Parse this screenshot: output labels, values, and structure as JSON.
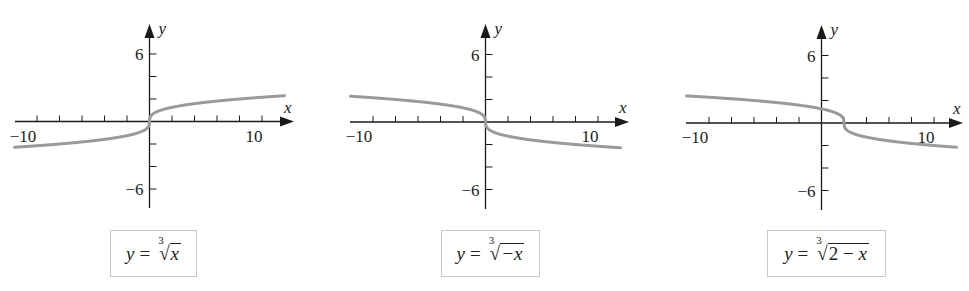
{
  "chart_data": [
    {
      "type": "line",
      "title": "",
      "function": "y = cbrt(x)",
      "formula_label": {
        "lhs": "y",
        "eq": "=",
        "index": "3",
        "radicand": "x"
      },
      "xlabel": "x",
      "ylabel": "y",
      "xlim": [
        -12,
        12
      ],
      "ylim": [
        -7.8,
        8.6
      ],
      "x_tick_labels": [
        "−10",
        "10"
      ],
      "x_tick_label_values": [
        -10,
        10
      ],
      "y_tick_labels": [
        "6",
        "−6"
      ],
      "y_tick_label_values": [
        6,
        -6
      ],
      "tick_step": 2,
      "grid": false,
      "legend": "none",
      "shift": 0,
      "reflect": false,
      "sample_points": {
        "x": [
          -12,
          -8,
          -2,
          0,
          2,
          8,
          12
        ],
        "y": [
          -2.29,
          -2,
          -1.26,
          0,
          1.26,
          2,
          2.29
        ]
      },
      "layout": {
        "ox": 149.5,
        "oy": 121.5,
        "unit": 11.25,
        "x_start": 15,
        "x_end": 294,
        "y_top": 24,
        "y_bottom": 208,
        "curve_x_range": [
          -12,
          12
        ],
        "box": {
          "left": 110,
          "top": 230,
          "width": 87,
          "height": 47
        }
      }
    },
    {
      "type": "line",
      "title": "",
      "function": "y = cbrt(-x)",
      "formula_label": {
        "lhs": "y",
        "eq": "=",
        "index": "3",
        "radicand": "−x"
      },
      "xlabel": "x",
      "ylabel": "y",
      "xlim": [
        -12,
        12
      ],
      "ylim": [
        -7.8,
        8.6
      ],
      "x_tick_labels": [
        "−10",
        "10"
      ],
      "x_tick_label_values": [
        -10,
        10
      ],
      "y_tick_labels": [
        "6",
        "−6"
      ],
      "y_tick_label_values": [
        6,
        -6
      ],
      "tick_step": 2,
      "grid": false,
      "legend": "none",
      "shift": 0,
      "reflect": true,
      "sample_points": {
        "x": [
          -12,
          -8,
          -2,
          0,
          2,
          8,
          12
        ],
        "y": [
          2.29,
          2,
          1.26,
          0,
          -1.26,
          -2,
          -2.29
        ]
      },
      "layout": {
        "ox": 485.5,
        "oy": 122,
        "unit": 11.25,
        "x_start": 350,
        "x_end": 629,
        "y_top": 24,
        "y_bottom": 209,
        "curve_x_range": [
          -12,
          12
        ],
        "box": {
          "left": 441,
          "top": 230,
          "width": 99,
          "height": 47
        }
      }
    },
    {
      "type": "line",
      "title": "",
      "function": "y = cbrt(2 - x)",
      "formula_label": {
        "lhs": "y",
        "eq": "=",
        "index": "3",
        "radicand": "2 − x"
      },
      "xlabel": "x",
      "ylabel": "y",
      "xlim": [
        -12,
        12
      ],
      "ylim": [
        -7.8,
        8.6
      ],
      "x_tick_labels": [
        "−10",
        "10"
      ],
      "x_tick_label_values": [
        -10,
        10
      ],
      "y_tick_labels": [
        "6",
        "−6"
      ],
      "y_tick_label_values": [
        6,
        -6
      ],
      "tick_step": 2,
      "grid": false,
      "legend": "none",
      "shift": 2,
      "reflect": true,
      "sample_points": {
        "x": [
          -12,
          -6,
          0,
          2,
          4,
          10,
          12
        ],
        "y": [
          2.41,
          2,
          1.26,
          0,
          -1.26,
          -2,
          -2.15
        ]
      },
      "layout": {
        "ox": 821.5,
        "oy": 123,
        "unit": 11.25,
        "x_start": 686,
        "x_end": 963,
        "y_top": 25,
        "y_bottom": 210,
        "curve_x_range": [
          -12,
          12
        ],
        "box": {
          "left": 767,
          "top": 230,
          "width": 119,
          "height": 47
        }
      }
    }
  ],
  "colors": {
    "axis": "#1a1a1a",
    "curve": "#9a9a9a",
    "box_border": "#c8c8c8",
    "background": "#ffffff"
  }
}
